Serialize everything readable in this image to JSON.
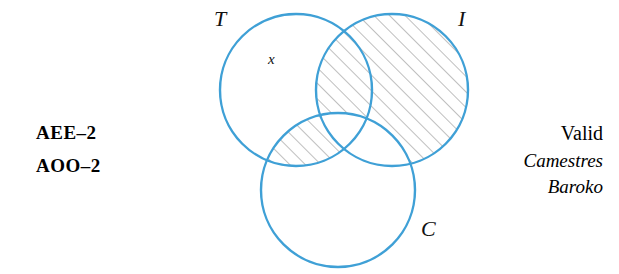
{
  "figure": {
    "type": "three-circle-venn-diagram-syllogism",
    "left_codes": [
      "AEE–2",
      "AOO–2"
    ],
    "right_block": {
      "validity": "Valid",
      "moods": [
        "Camestres",
        "Baroko"
      ]
    },
    "circle_labels": {
      "top_left": "T",
      "top_right": "I",
      "bottom": "C"
    },
    "marks": {
      "x_mark": "x"
    },
    "colors": {
      "circle_stroke": "#3fa0d6",
      "hatch_stroke": "#8a8a8a",
      "text": "#111111",
      "background": "#ffffff"
    },
    "circles": [
      {
        "name": "T",
        "cx": 296,
        "cy": 90,
        "r": 76
      },
      {
        "name": "I",
        "cx": 392,
        "cy": 90,
        "r": 76
      },
      {
        "name": "C",
        "cx": 338,
        "cy": 190,
        "r": 77
      }
    ],
    "shaded_regions": [
      "I-minus-C",
      "T-and-C-minus-I"
    ]
  }
}
